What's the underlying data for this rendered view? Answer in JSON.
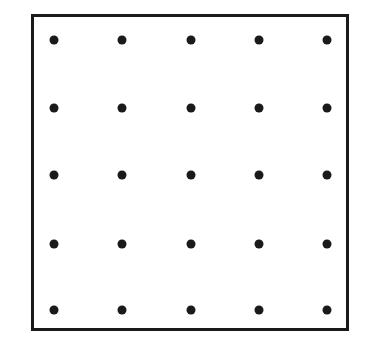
{
  "diagram": {
    "type": "dot-grid",
    "rows": 5,
    "cols": 5,
    "dot_color": "#1a1a1a",
    "frame_color": "#1a1a1a",
    "x_positions": [
      54,
      122,
      191,
      259,
      327
    ],
    "y_positions": [
      40,
      108,
      175,
      244,
      310
    ]
  }
}
